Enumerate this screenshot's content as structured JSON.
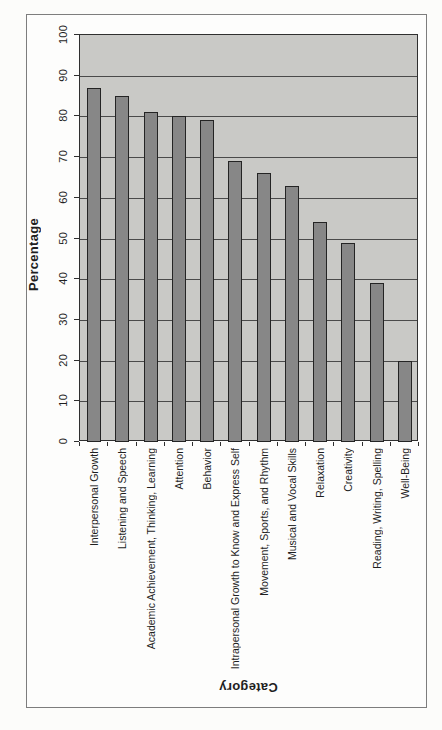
{
  "page": {
    "background": "#fcfcfa",
    "frame_border_color": "#7d7d7d"
  },
  "chart_data": {
    "type": "bar",
    "title": "",
    "xlabel": "Category",
    "ylabel": "Percentage",
    "categories": [
      "Interpersonal Growth",
      "Listening and Speech",
      "Academic Achievement, Thinking, Learning",
      "Attention",
      "Behavior",
      "Intrapersonal Growth to Know and Express Self",
      "Movement, Sports, and Rhythm",
      "Musical and Vocal Skills",
      "Relaxation",
      "Creativity",
      "Reading, Writing, Spelling",
      "Well-Being"
    ],
    "values": [
      87,
      85,
      81,
      80,
      79,
      69,
      66,
      63,
      54,
      49,
      39,
      20
    ],
    "ylim": [
      0,
      100
    ],
    "ytick_step": 10,
    "yticks": [
      "0",
      "10",
      "20",
      "30",
      "40",
      "50",
      "60",
      "70",
      "80",
      "90",
      "100"
    ],
    "grid": "horizontal",
    "legend": "none",
    "text_rotation_note": "tick and category text rotated 90deg, x-axis title rotated 180deg",
    "colors": {
      "plot_background": "#c9c9c6",
      "bar_fill": "#878787",
      "bar_border": "#242424",
      "gridline": "#4a4a4a",
      "axis_line": "#2f2f2f",
      "text": "#1f1f1f"
    }
  }
}
